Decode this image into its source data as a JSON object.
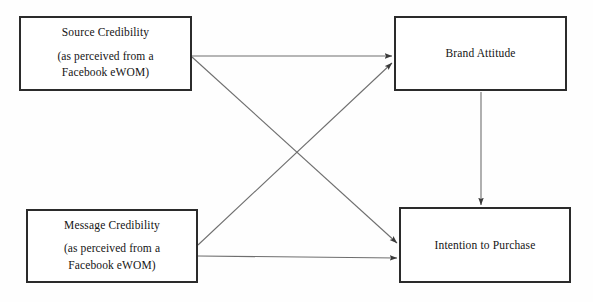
{
  "figure": {
    "type": "conceptual-model-diagram",
    "background_color": "#fefefe",
    "line_color": "#6e6e6e",
    "border_color": "#2b2b2b",
    "text_color": "#141414",
    "width": 593,
    "height": 302
  },
  "nodes": {
    "source_credibility": {
      "title": "Source Credibility",
      "sub_line1": "(as perceived from a",
      "sub_line2": "Facebook eWOM)",
      "x": 19,
      "y": 16,
      "w": 173,
      "h": 75
    },
    "message_credibility": {
      "title": "Message Credibility",
      "sub_line1": "(as perceived from a",
      "sub_line2": "Facebook eWOM)",
      "x": 26,
      "y": 209,
      "w": 172,
      "h": 74
    },
    "brand_attitude": {
      "title": "Brand Attitude",
      "x": 394,
      "y": 16,
      "w": 173,
      "h": 75
    },
    "intention_to_purchase": {
      "title": "Intention to Purchase",
      "x": 399,
      "y": 207,
      "w": 172,
      "h": 76
    }
  },
  "edges": [
    {
      "name": "source-to-brand-attitude",
      "from": "source_credibility",
      "to": "brand_attitude",
      "shape": "horizontal",
      "x1": 192,
      "y1": 56,
      "x2": 392,
      "y2": 56
    },
    {
      "name": "source-to-intention",
      "from": "source_credibility",
      "to": "intention_to_purchase",
      "shape": "diagonal-down",
      "x1": 192,
      "y1": 57,
      "x2": 397,
      "y2": 243
    },
    {
      "name": "message-to-brand-attitude",
      "from": "message_credibility",
      "to": "brand_attitude",
      "shape": "diagonal-up",
      "x1": 198,
      "y1": 245,
      "x2": 392,
      "y2": 63
    },
    {
      "name": "message-to-intention",
      "from": "message_credibility",
      "to": "intention_to_purchase",
      "shape": "horizontal",
      "x1": 198,
      "y1": 256,
      "x2": 397,
      "y2": 258
    },
    {
      "name": "brand-attitude-to-intention",
      "from": "brand_attitude",
      "to": "intention_to_purchase",
      "shape": "vertical",
      "x1": 481,
      "y1": 92,
      "x2": 481,
      "y2": 205
    }
  ]
}
